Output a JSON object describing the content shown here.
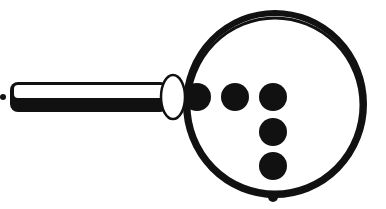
{
  "figure": {
    "colors": {
      "ink": "#111111",
      "paper": "#ffffff"
    },
    "width": 386,
    "height": 209
  },
  "shapes": {
    "lead_dot": {
      "cx": 3,
      "cy": 97,
      "r": 3
    },
    "rod": {
      "x": 10,
      "y": 82,
      "width": 158,
      "height": 30,
      "rx": 8,
      "split_y": 98
    },
    "connector_ellipse": {
      "cx": 173,
      "cy": 97,
      "rx": 12,
      "ry": 22
    },
    "ring": {
      "cx": 275,
      "cy": 104,
      "rx": 89,
      "ry": 91,
      "stroke": 6
    },
    "dots": [
      {
        "cx": 197,
        "cy": 97,
        "r": 14
      },
      {
        "cx": 235,
        "cy": 97,
        "r": 14
      },
      {
        "cx": 273,
        "cy": 97,
        "r": 14
      },
      {
        "cx": 273,
        "cy": 132,
        "r": 14
      },
      {
        "cx": 273,
        "cy": 166,
        "r": 14
      }
    ],
    "tail_dot": {
      "cx": 273,
      "cy": 197,
      "r": 5
    }
  }
}
